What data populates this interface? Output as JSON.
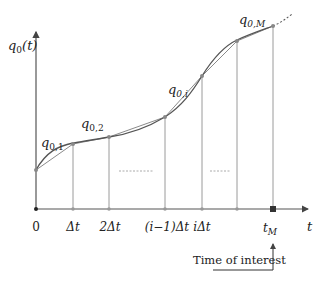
{
  "diagram": {
    "type": "piecewise-linear approximation of curve",
    "y_axis_label": {
      "base": "q",
      "sub": "0",
      "tail": "(t)"
    },
    "x_axis_label": "t",
    "x_ticks": [
      {
        "text": "0"
      },
      {
        "text": "Δt"
      },
      {
        "text": "2Δt"
      },
      {
        "text": "(i−1)Δt"
      },
      {
        "text": "iΔt"
      },
      {
        "text": ""
      },
      {
        "text": "t",
        "sub": "M"
      }
    ],
    "segment_labels": [
      {
        "base": "q",
        "sub": "0,1"
      },
      {
        "base": "q",
        "sub": "0,2"
      },
      {
        "base": "q",
        "sub": "0,i"
      },
      {
        "base": "q",
        "sub": "0,M"
      }
    ],
    "annotation": "Time of interest",
    "colors": {
      "axis": "#555555",
      "curve": "#555555",
      "chord": "#888888",
      "gridline": "#999999",
      "ellipsis": "#aaaaaa",
      "point": "#888888",
      "highlight_point": "#333333"
    }
  }
}
